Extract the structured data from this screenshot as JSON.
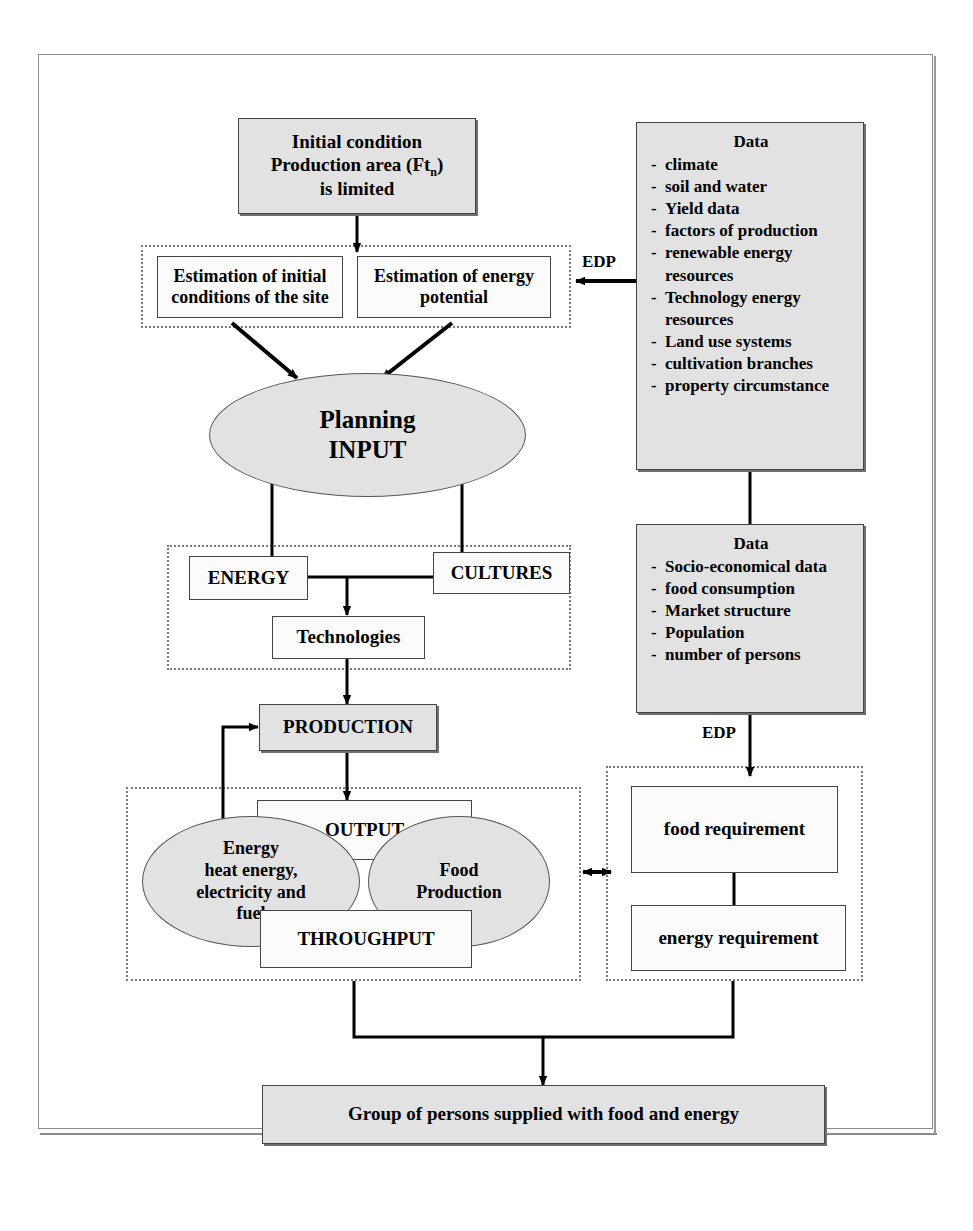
{
  "diagram": {
    "colors": {
      "fill_gray": "#e2e2e2",
      "fill_white": "#fbfbfb",
      "stroke": "#444444",
      "group_dotted": "#7a7a7a",
      "page_frame": "#8a8a8a"
    },
    "nodes": {
      "initial_condition": {
        "line1": "Initial condition",
        "line2_pre": "Production area (Ft",
        "line2_sub": "n",
        "line2_post": ")",
        "line3": "is limited"
      },
      "estimation_initial": {
        "line1": "Estimation of initial",
        "line2": "conditions of the site"
      },
      "estimation_energy": {
        "line1": "Estimation of energy",
        "line2": "potential"
      },
      "planning_input": {
        "line1": "Planning",
        "line2": "INPUT"
      },
      "energy": {
        "label": "ENERGY"
      },
      "cultures": {
        "label": "CULTURES"
      },
      "technologies": {
        "label": "Technologies"
      },
      "production": {
        "label": "PRODUCTION"
      },
      "output": {
        "label": "OUTPUT"
      },
      "throughput": {
        "label": "THROUGHPUT"
      },
      "energy_ellipse": {
        "line1": "Energy",
        "line2": "heat energy,",
        "line3": "electricity and",
        "line4": "fuel"
      },
      "food_ellipse": {
        "line1": "Food",
        "line2": "Production"
      },
      "food_requirement": {
        "label": "food requirement"
      },
      "energy_requirement": {
        "label": "energy requirement"
      },
      "group_supplied": {
        "label": "Group of persons supplied with food and energy"
      }
    },
    "data_box_top": {
      "title": "Data",
      "items": [
        "climate",
        "soil and water",
        "Yield data",
        "factors of production",
        "renewable energy resources",
        "Technology energy resources",
        "Land use systems",
        "cultivation branches",
        "property circumstance"
      ]
    },
    "data_box_bottom": {
      "title": "Data",
      "items": [
        "Socio-economical data",
        "food consumption",
        "Market structure",
        "Population",
        "number of persons"
      ]
    },
    "edge_labels": {
      "edp_top": "EDP",
      "edp_bottom": "EDP"
    }
  }
}
